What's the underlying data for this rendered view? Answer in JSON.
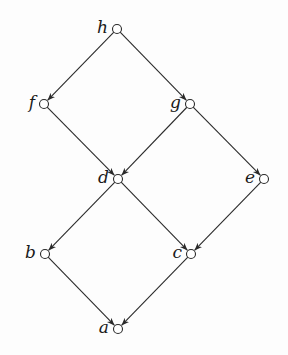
{
  "diagram": {
    "type": "hasse-diagram",
    "nodes": [
      {
        "id": "h",
        "label": "h",
        "x": 117,
        "y": 29
      },
      {
        "id": "f",
        "label": "f",
        "x": 44,
        "y": 104
      },
      {
        "id": "g",
        "label": "g",
        "x": 190,
        "y": 104
      },
      {
        "id": "d",
        "label": "d",
        "x": 118,
        "y": 179
      },
      {
        "id": "e",
        "label": "e",
        "x": 264,
        "y": 179
      },
      {
        "id": "b",
        "label": "b",
        "x": 45,
        "y": 254
      },
      {
        "id": "c",
        "label": "c",
        "x": 191,
        "y": 254
      },
      {
        "id": "a",
        "label": "a",
        "x": 118,
        "y": 329
      }
    ],
    "edges": [
      {
        "from": "h",
        "to": "f"
      },
      {
        "from": "h",
        "to": "g"
      },
      {
        "from": "f",
        "to": "d"
      },
      {
        "from": "g",
        "to": "d"
      },
      {
        "from": "g",
        "to": "e"
      },
      {
        "from": "d",
        "to": "b"
      },
      {
        "from": "d",
        "to": "c"
      },
      {
        "from": "e",
        "to": "c"
      },
      {
        "from": "b",
        "to": "a"
      },
      {
        "from": "c",
        "to": "a"
      }
    ],
    "colors": {
      "stroke": "#2a2a2a",
      "background": "#fdfdfd"
    }
  }
}
